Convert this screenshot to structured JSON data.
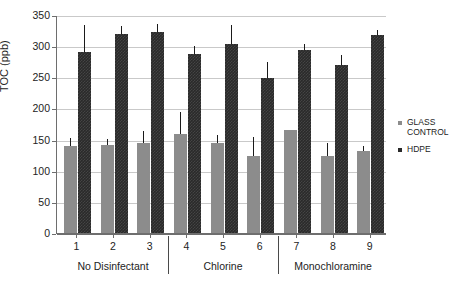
{
  "chart_data": {
    "type": "bar",
    "title": "",
    "xlabel": "",
    "ylabel": "TOC (ppb)",
    "ylim": [
      0,
      350
    ],
    "ytick_labels": [
      "0",
      "50",
      "100",
      "150",
      "200",
      "250",
      "300",
      "350"
    ],
    "ytick_values": [
      0,
      50,
      100,
      150,
      200,
      250,
      300,
      350
    ],
    "grid": true,
    "legend_position": "right",
    "categories": [
      "1",
      "2",
      "3",
      "4",
      "5",
      "6",
      "7",
      "8",
      "9"
    ],
    "groups": [
      {
        "label": "No Disinfectant",
        "categories": [
          "1",
          "2",
          "3"
        ]
      },
      {
        "label": "Chlorine",
        "categories": [
          "4",
          "5",
          "6"
        ]
      },
      {
        "label": "Monochloramine",
        "categories": [
          "7",
          "8",
          "9"
        ]
      }
    ],
    "series": [
      {
        "name": "GLASS CONTROL",
        "color": "#8c8c8c",
        "values": [
          139,
          141,
          145,
          159,
          145,
          124,
          165,
          124,
          131
        ],
        "error_upper": [
          13,
          10,
          19,
          36,
          12,
          30,
          0,
          21,
          9
        ]
      },
      {
        "name": "HDPE",
        "color": "#2a2a2a",
        "values": [
          291,
          319,
          323,
          288,
          303,
          249,
          294,
          269,
          318
        ],
        "error_upper": [
          43,
          13,
          13,
          13,
          31,
          25,
          10,
          17,
          8
        ]
      }
    ]
  },
  "legend": {
    "entries": [
      {
        "label_line1": "GLASS",
        "label_line2": "CONTROL",
        "swatch": "glass-swatch"
      },
      {
        "label_line1": "HDPE",
        "label_line2": "",
        "swatch": "hdpe-swatch"
      }
    ]
  }
}
